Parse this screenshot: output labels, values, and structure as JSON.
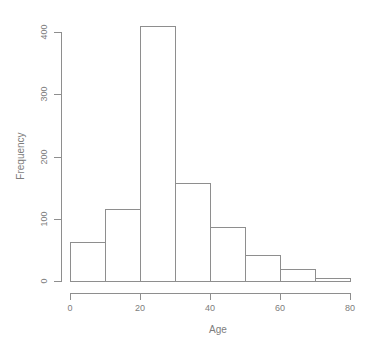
{
  "figure": {
    "background": "#ffffff"
  },
  "chart_data": {
    "type": "bar",
    "subtype": "histogram",
    "title": "",
    "xlabel": "Age",
    "ylabel": "Frequency",
    "bin_breaks": [
      0,
      10,
      20,
      30,
      40,
      50,
      60,
      70,
      80
    ],
    "counts": [
      63,
      115,
      410,
      157,
      87,
      42,
      20,
      5
    ],
    "x_ticks": [
      0,
      20,
      40,
      60,
      80
    ],
    "y_ticks": [
      0,
      100,
      200,
      300,
      400
    ],
    "xlim": [
      0,
      80
    ],
    "ylim": [
      0,
      400
    ],
    "grid": false,
    "legend_position": "none",
    "bar_fill": "#ffffff",
    "bar_border": "#8e8e8e",
    "axis_color": "#8e8e8e",
    "text_color": "#7d7d7d"
  }
}
